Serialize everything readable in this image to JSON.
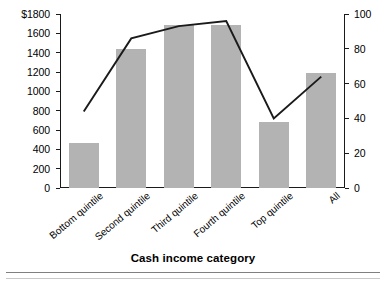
{
  "chart_data": {
    "type": "bar",
    "title": "",
    "subtitle": "",
    "xlabel": "Cash income category",
    "ylabel": "",
    "categories": [
      "Bottom quintile",
      "Second quintile",
      "Third quintile",
      "Fourth quintile",
      "Top quintile",
      "All"
    ],
    "series": [
      {
        "name": "bars",
        "type": "bar",
        "axis": "left",
        "color": "#b3b3b3",
        "values": [
          470,
          1440,
          1690,
          1690,
          680,
          1190
        ]
      },
      {
        "name": "line",
        "type": "line",
        "axis": "right",
        "color": "#1a1a1a",
        "values": [
          44,
          86,
          93,
          96,
          40,
          64
        ]
      }
    ],
    "ylim": [
      0,
      1800
    ],
    "ylim_right": [
      0,
      100
    ],
    "yticks": [
      0,
      200,
      400,
      600,
      800,
      1000,
      1200,
      1400,
      1600,
      1800
    ],
    "ytick_labels": [
      "0",
      "200",
      "400",
      "600",
      "800",
      "1000",
      "1200",
      "1400",
      "1600",
      "$1800"
    ],
    "yticks_right": [
      0,
      20,
      40,
      60,
      80,
      100
    ],
    "ytick_labels_right": [
      "0",
      "20",
      "40",
      "60",
      "80",
      "100"
    ],
    "grid": false,
    "legend": "none"
  },
  "axis": {
    "left_top_label": "$1800",
    "right_top_label": "100"
  },
  "footer": {
    "x_axis_title": "Cash income category"
  }
}
